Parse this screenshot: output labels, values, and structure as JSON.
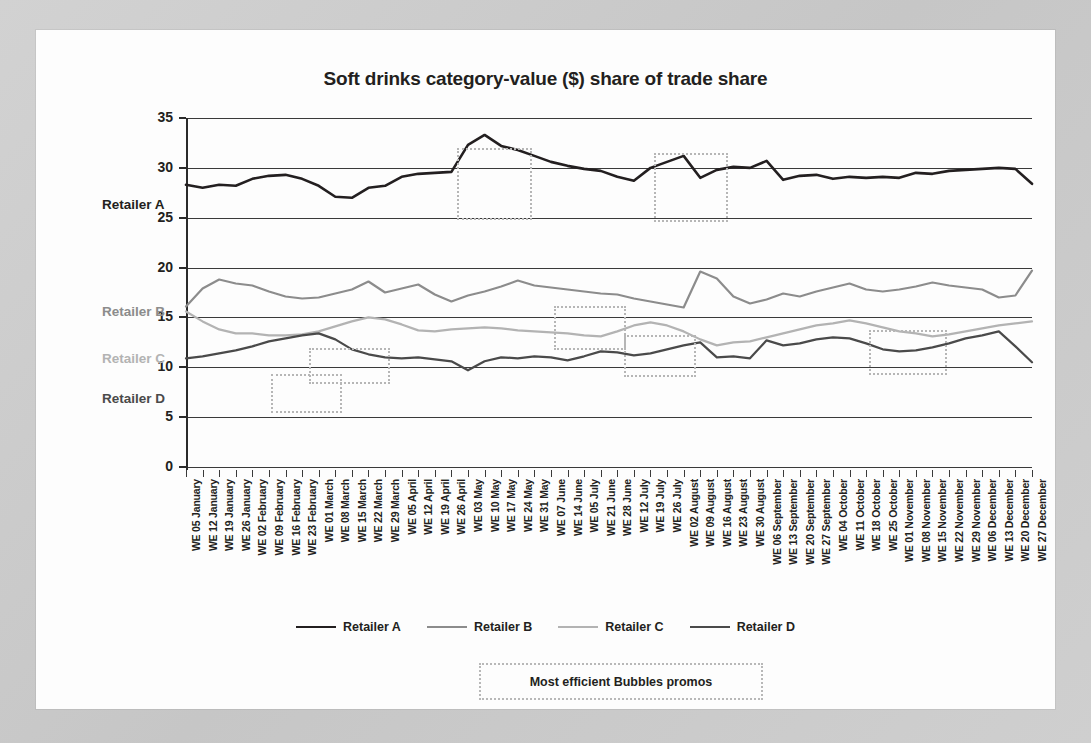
{
  "card": {
    "background_color": "#fdfdfd",
    "page_background_color": "#c9c9c9"
  },
  "chart_data": {
    "type": "line",
    "title": "Soft drinks category-value ($) share of trade share",
    "xlabel": "",
    "ylabel": "",
    "ylim": [
      0,
      35
    ],
    "yticks": [
      0,
      5,
      10,
      15,
      20,
      25,
      30,
      35
    ],
    "grid": true,
    "legend_position": "bottom",
    "categories": [
      "WE 05 January",
      "WE 12 January",
      "WE 19 January",
      "WE 26 January",
      "WE 02 February",
      "WE 09 February",
      "WE 16 February",
      "WE 23 February",
      "WE 01 March",
      "WE 08 March",
      "WE 15 March",
      "WE 22 March",
      "WE 29 March",
      "WE 05 April",
      "WE 12 April",
      "WE 19 April",
      "WE 26 April",
      "WE 03 May",
      "WE 10 May",
      "WE 17 May",
      "WE 24 May",
      "WE 31 May",
      "WE 07 June",
      "WE 14 June",
      "WE 05 July",
      "WE 21 June",
      "WE 28 June",
      "WE 12 July",
      "WE 19 July",
      "WE 26 July",
      "WE 02 August",
      "WE 09 August",
      "WE 16 August",
      "WE 23 August",
      "WE 30 August",
      "WE 06 September",
      "WE 13 September",
      "WE 20 September",
      "WE 27 September",
      "WE 04 October",
      "WE 11 October",
      "WE 18 October",
      "WE 25 October",
      "WE 01 November",
      "WE 08 November",
      "WE 15 November",
      "WE 22 November",
      "WE 29 November",
      "WE 06 December",
      "WE 13 December",
      "WE 20 December",
      "WE 27 December"
    ],
    "series": [
      {
        "name": "Retailer A",
        "color": "#231f20",
        "width": 2.6,
        "values": [
          28.3,
          28.0,
          28.3,
          28.2,
          28.9,
          29.2,
          29.3,
          28.9,
          28.2,
          27.1,
          27.0,
          28.0,
          28.2,
          29.1,
          29.4,
          29.5,
          29.6,
          32.3,
          33.3,
          32.2,
          31.8,
          31.2,
          30.6,
          30.2,
          29.9,
          29.7,
          29.1,
          28.7,
          30.0,
          30.6,
          31.2,
          29.0,
          29.8,
          30.1,
          30.0,
          30.7,
          28.8,
          29.2,
          29.3,
          28.9,
          29.1,
          29.0,
          29.1,
          29.0,
          29.5,
          29.4,
          29.7,
          29.8,
          29.9,
          30.0,
          29.9,
          28.4
        ]
      },
      {
        "name": "Retailer B",
        "color": "#8c8c8c",
        "width": 2.2,
        "values": [
          16.1,
          17.9,
          18.8,
          18.4,
          18.2,
          17.6,
          17.1,
          16.9,
          17.0,
          17.4,
          17.8,
          18.6,
          17.5,
          17.9,
          18.3,
          17.3,
          16.6,
          17.2,
          17.6,
          18.1,
          18.7,
          18.2,
          18.0,
          17.8,
          17.6,
          17.4,
          17.3,
          16.9,
          16.6,
          16.3,
          16.0,
          19.6,
          18.9,
          17.1,
          16.4,
          16.8,
          17.4,
          17.1,
          17.6,
          18.0,
          18.4,
          17.8,
          17.6,
          17.8,
          18.1,
          18.5,
          18.2,
          18.0,
          17.8,
          17.0,
          17.2,
          19.7
        ]
      },
      {
        "name": "Retailer C",
        "color": "#b3b3b3",
        "width": 2.2,
        "values": [
          15.6,
          14.6,
          13.8,
          13.4,
          13.4,
          13.2,
          13.2,
          13.3,
          13.6,
          14.1,
          14.6,
          15.0,
          14.8,
          14.3,
          13.7,
          13.6,
          13.8,
          13.9,
          14.0,
          13.9,
          13.7,
          13.6,
          13.5,
          13.4,
          13.2,
          13.1,
          13.6,
          14.2,
          14.5,
          14.2,
          13.6,
          12.8,
          12.2,
          12.5,
          12.6,
          13.0,
          13.4,
          13.8,
          14.2,
          14.4,
          14.7,
          14.4,
          14.0,
          13.6,
          13.4,
          13.1,
          13.3,
          13.6,
          13.9,
          14.2,
          14.4,
          14.6
        ]
      },
      {
        "name": "Retailer D",
        "color": "#4a4a4a",
        "width": 2.2,
        "values": [
          10.9,
          11.1,
          11.4,
          11.7,
          12.1,
          12.6,
          12.9,
          13.2,
          13.4,
          12.8,
          11.8,
          11.3,
          11.0,
          10.9,
          11.0,
          10.8,
          10.6,
          9.7,
          10.6,
          11.0,
          10.9,
          11.1,
          11.0,
          10.7,
          11.1,
          11.6,
          11.5,
          11.2,
          11.4,
          11.8,
          12.2,
          12.5,
          11.0,
          11.1,
          10.9,
          12.7,
          12.2,
          12.4,
          12.8,
          13.0,
          12.9,
          12.4,
          11.8,
          11.6,
          11.7,
          12.0,
          12.4,
          12.9,
          13.2,
          13.6,
          12.1,
          10.5
        ]
      }
    ],
    "annotations": {
      "key_label": "Most efficient Bubbles promos",
      "box_style": "dotted",
      "box_color": "#b6b6b6",
      "boxes": [
        {
          "id": "promo-box-1",
          "x": 235,
          "y": 344,
          "width": 71,
          "height": 39
        },
        {
          "id": "promo-box-2",
          "x": 273,
          "y": 318,
          "width": 81,
          "height": 36
        },
        {
          "id": "promo-box-3",
          "x": 421,
          "y": 118,
          "width": 75,
          "height": 72
        },
        {
          "id": "promo-box-4",
          "x": 518,
          "y": 276,
          "width": 72,
          "height": 44
        },
        {
          "id": "promo-box-5",
          "x": 588,
          "y": 305,
          "width": 72,
          "height": 42
        },
        {
          "id": "promo-box-6",
          "x": 618,
          "y": 123,
          "width": 74,
          "height": 69
        },
        {
          "id": "promo-box-7",
          "x": 833,
          "y": 300,
          "width": 78,
          "height": 45
        }
      ]
    }
  },
  "side_labels": [
    {
      "name": "Retailer A",
      "y": 176,
      "color": "#231f20"
    },
    {
      "name": "Retailer B",
      "y": 283,
      "color": "#8c8c8c"
    },
    {
      "name": "Retailer C",
      "y": 330,
      "color": "#b3b3b3"
    },
    {
      "name": "Retailer D",
      "y": 370,
      "color": "#4a4a4a"
    }
  ]
}
